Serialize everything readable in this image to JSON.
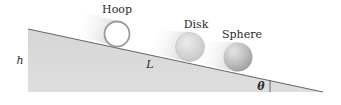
{
  "diagram": {
    "type": "physics-incline",
    "colors": {
      "background": "#ffffff",
      "incline_fill": "#d9d9d9",
      "incline_edge": "#555555",
      "hoop_stroke": "#9a9a9a",
      "disk_fill": "#d4d4d4",
      "sphere_fill": "#c2c2c2",
      "text": "#2a2a2a"
    },
    "incline": {
      "height_label": "h",
      "length_label": "L",
      "angle_label": "θ"
    },
    "objects": [
      {
        "id": "hoop",
        "label": "Hoop"
      },
      {
        "id": "disk",
        "label": "Disk"
      },
      {
        "id": "sphere",
        "label": "Sphere"
      }
    ]
  }
}
